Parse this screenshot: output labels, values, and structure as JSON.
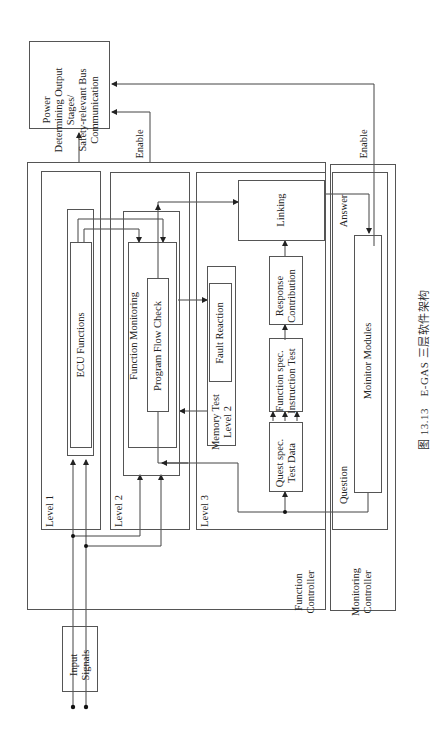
{
  "diagram": {
    "orientation": "rotated-90-ccw",
    "output_block": {
      "label_lines": [
        "Power",
        "Determining Output",
        "Stages/",
        "Safety-relevant Bus",
        "Communication"
      ]
    },
    "input_block": {
      "label_lines": [
        "Input",
        "Signals"
      ]
    },
    "function_controller": {
      "label_lines": [
        "Function",
        "Controller"
      ],
      "level1": {
        "label": "Level 1",
        "ecu_functions": "ECU Functions"
      },
      "level2": {
        "label": "Level 2",
        "function_monitoring": "Function Monitoring",
        "program_flow_check": "Program Flow Check"
      },
      "level3": {
        "label": "Level 3",
        "memory_test_lines": [
          "Memory Test",
          "Level 2"
        ],
        "fault_reaction": "Fault Reaction",
        "linking": "Linking",
        "response_contribution_lines": [
          "Response",
          "Contribution"
        ],
        "function_spec_lines": [
          "Function spec.",
          "Instruction Test"
        ],
        "quest_spec_lines": [
          "Quest spec.",
          "Test Data"
        ]
      }
    },
    "monitoring_controller": {
      "label_lines": [
        "Monitoring",
        "Controller"
      ],
      "monitor_modules": "Moinitor Modules",
      "question": "Question",
      "answer": "Answer"
    },
    "edge_labels": {
      "enable_fc": "Enable",
      "enable_mc": "Enable"
    }
  },
  "caption": "图 13.13　E-GAS 三层软件架构"
}
